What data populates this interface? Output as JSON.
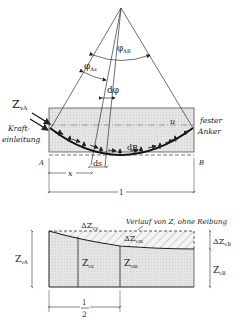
{
  "top_diagram": {
    "angle_total": "φ",
    "angle_total_sub": "AB",
    "angle_partial": "φ",
    "angle_partial_sub": "Ax",
    "angle_diff": "dφ",
    "force_label": "Z",
    "force_sub": "vA",
    "anchor_live_line1": "Kraft-",
    "anchor_live_line2": "einleitung",
    "anchor_fixed_line1": "fester",
    "anchor_fixed_line2": "Anker",
    "u_label": "u",
    "dR_label": "dR",
    "ds_label": "ds",
    "point_a": "A",
    "point_b": "B",
    "x_label": "x",
    "l_label": "l"
  },
  "bottom_diagram": {
    "note": "Verlauf von Z, ohne Reibung",
    "dZ_x": "ΔZ",
    "dZ_x_sub": "vx",
    "dZ_m": "ΔZ",
    "dZ_m_sub": "vm",
    "dZ_B": "ΔZ",
    "dZ_B_sub": "vB",
    "Z_A": "Z",
    "Z_A_sub": "vA",
    "Z_x": "Z",
    "Z_x_sub": "vx",
    "Z_m": "Z",
    "Z_m_sub": "vm",
    "Z_B": "Z",
    "Z_B_sub": "vB",
    "half_num": "l",
    "half_den": "2"
  }
}
